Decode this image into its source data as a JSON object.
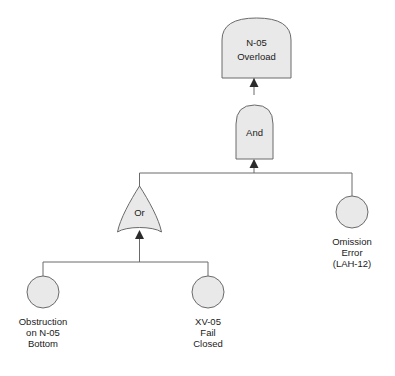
{
  "diagram": {
    "type": "fault-tree",
    "colors": {
      "node_fill": "#e9e9e9",
      "node_stroke": "#6a6a6a",
      "connector": "#6a6a6a",
      "arrow": "#2b2b2b",
      "text": "#1a1a1a",
      "background": "#ffffff"
    }
  },
  "top_event": {
    "id": "top-event",
    "shape": "rounded-top-rectangle",
    "line1": "N-05",
    "line2": "Overload"
  },
  "gates": [
    {
      "id": "and-gate",
      "shape": "and-gate",
      "label": "And"
    },
    {
      "id": "or-gate",
      "shape": "or-gate",
      "label": "Or"
    }
  ],
  "basic_events": [
    {
      "id": "omission-error",
      "shape": "circle",
      "line1": "Omission",
      "line2": "Error",
      "line3": "(LAH-12)"
    },
    {
      "id": "obstruction",
      "shape": "circle",
      "line1": "Obstruction",
      "line2": "on N-05",
      "line3": "Bottom"
    },
    {
      "id": "xv05-fail-closed",
      "shape": "circle",
      "line1": "XV-05",
      "line2": "Fail",
      "line3": "Closed"
    }
  ]
}
